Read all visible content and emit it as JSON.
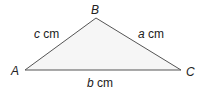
{
  "diagram": {
    "type": "triangle",
    "colors": {
      "stroke": "#555555",
      "fill": "#f6f6f6",
      "text": "#222222"
    },
    "vertices": {
      "A": {
        "label": "A",
        "x": 25,
        "y": 70
      },
      "B": {
        "label": "B",
        "x": 96,
        "y": 18
      },
      "C": {
        "label": "C",
        "x": 181,
        "y": 70
      }
    },
    "sides": {
      "c": {
        "variable": "c",
        "unit": " cm",
        "between": "A-B"
      },
      "a": {
        "variable": "a",
        "unit": " cm",
        "between": "B-C"
      },
      "b": {
        "variable": "b",
        "unit": " cm",
        "between": "A-C"
      }
    }
  }
}
